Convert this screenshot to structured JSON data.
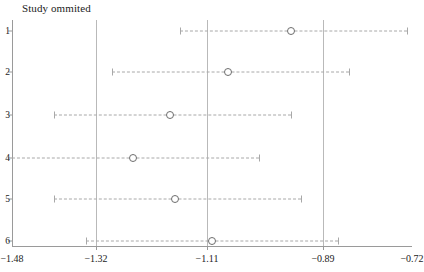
{
  "chart_data": {
    "type": "scatter",
    "title": "Study ommited",
    "xlabel": "",
    "ylabel": "",
    "grid": false,
    "legend": null,
    "xlim": [
      -1.48,
      -0.72
    ],
    "xticks": [
      -1.48,
      -1.32,
      -1.11,
      -0.89,
      -0.72
    ],
    "xtick_labels": [
      "−1.48",
      "−1.32",
      "−1.11",
      "−0.89",
      "−0.72"
    ],
    "yticks": [
      1,
      2,
      3,
      4,
      5,
      6
    ],
    "ytick_labels": [
      "1",
      "2",
      "3",
      "4",
      "5",
      "6"
    ],
    "reference_lines": [
      -1.32,
      -1.11,
      -0.89
    ],
    "categories": [
      "1",
      "2",
      "3",
      "4",
      "5",
      "6"
    ],
    "estimates": [
      -0.95,
      -1.07,
      -1.18,
      -1.25,
      -1.17,
      -1.1
    ],
    "ci_lower": [
      -1.16,
      -1.29,
      -1.4,
      -1.48,
      -1.4,
      -1.34
    ],
    "ci_upper": [
      -0.73,
      -0.84,
      -0.95,
      -1.01,
      -0.93,
      -0.86
    ],
    "rows": [
      {
        "label": "1",
        "estimate": -0.95,
        "lower": -1.16,
        "upper": -0.73
      },
      {
        "label": "2",
        "estimate": -1.07,
        "lower": -1.29,
        "upper": -0.84
      },
      {
        "label": "3",
        "estimate": -1.18,
        "lower": -1.4,
        "upper": -0.95
      },
      {
        "label": "4",
        "estimate": -1.25,
        "lower": -1.48,
        "upper": -1.01
      },
      {
        "label": "5",
        "estimate": -1.17,
        "lower": -1.4,
        "upper": -0.93
      },
      {
        "label": "6",
        "estimate": -1.1,
        "lower": -1.34,
        "upper": -0.86
      }
    ],
    "colors": {
      "axis": "#9a9a9a",
      "reference_line": "#b9b9b9",
      "interval": "#a8a8a8",
      "point_edge": "#6d6d6d",
      "text": "#222222",
      "background": "#ffffff"
    }
  }
}
